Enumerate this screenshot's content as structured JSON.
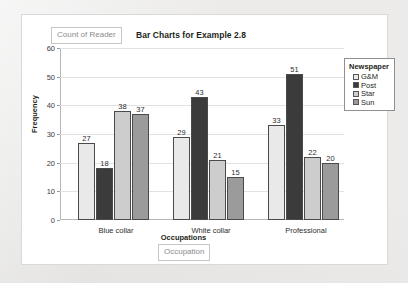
{
  "card": {
    "count_pill_label": "Count of Reader",
    "occupation_pill_label": "Occupation"
  },
  "chart_data": {
    "type": "bar",
    "title": "Bar Charts for Example 2.8",
    "xlabel": "Occupations",
    "ylabel": "Frequency",
    "ylim": [
      0,
      60
    ],
    "ytick_step": 10,
    "yticks": [
      "0",
      "10",
      "20",
      "30",
      "40",
      "50",
      "60"
    ],
    "grid": true,
    "legend_title": "Newspaper",
    "legend_position": "right",
    "categories": [
      "Blue collar",
      "White collar",
      "Professional"
    ],
    "series": [
      {
        "name": "G&M",
        "color": "#e9e9e9",
        "values": [
          27,
          29,
          33
        ]
      },
      {
        "name": "Post",
        "color": "#3b3b3b",
        "values": [
          18,
          43,
          51
        ]
      },
      {
        "name": "Star",
        "color": "#cdcdcd",
        "values": [
          38,
          21,
          22
        ]
      },
      {
        "name": "Sun",
        "color": "#9b9b9b",
        "values": [
          37,
          15,
          20
        ]
      }
    ]
  }
}
